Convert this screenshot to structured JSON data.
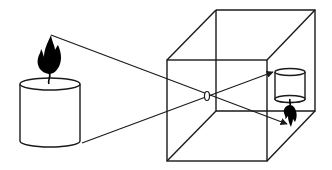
{
  "diagram": {
    "title": "Pinhole camera (camera obscura)",
    "colors": {
      "stroke": "#1a1a1a",
      "flame": "#000000",
      "background": "#ffffff"
    },
    "elements": {
      "object": "candle with flame",
      "aperture": "pinhole",
      "enclosure": "box (camera obscura)",
      "image": "inverted candle image"
    }
  }
}
